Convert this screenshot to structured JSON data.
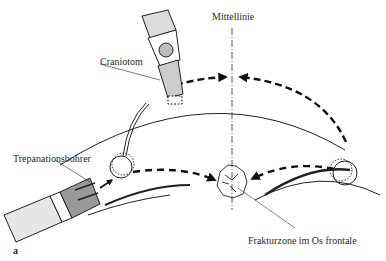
{
  "labels": {
    "midline": "Mittellinie",
    "craniotome": "Craniotom",
    "trepanation_drill": "Trepanationsbohrer",
    "fracture_zone": "Frakturzone im Os frontale",
    "panel": "a"
  },
  "icons": {
    "craniotome": "craniotome-tool-icon",
    "drill": "trepanation-drill-icon",
    "burr_hole": "burr-hole-circle-icon",
    "fracture": "fracture-zone-icon",
    "arrow": "dashed-arrow-icon"
  },
  "colors": {
    "ink": "#1a1a1a",
    "background": "#ffffff"
  }
}
